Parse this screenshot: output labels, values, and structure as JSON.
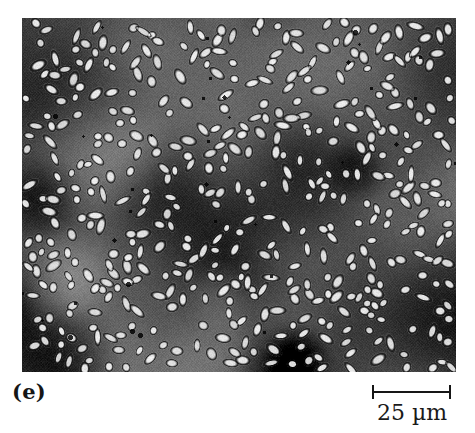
{
  "figure": {
    "panel_label": "(e)",
    "kind": "phase-contrast light micrograph",
    "frame": {
      "x": 22,
      "y": 18,
      "width": 434,
      "height": 354
    }
  },
  "scalebar": {
    "label": "25 µm",
    "value": 25,
    "unit": "µm",
    "bar_length_px": 79,
    "color": "#161616"
  },
  "palette": {
    "page_background": "#ffffff",
    "ink": "#161616",
    "field_mid_grey": "#6a6a6a",
    "field_dark_grey": "#343434",
    "field_light_grey": "#9a9a9a",
    "cell_halo_white": "#f2f2f2",
    "cell_outline_black": "#141414"
  },
  "render": {
    "seed": 20250607,
    "cell_count": 470,
    "cell_length_min_px": 7,
    "cell_length_max_px": 15,
    "cell_width_min_px": 5,
    "cell_width_max_px": 8,
    "halftone_period_px": 3,
    "blob_count": 46,
    "vignette_strength": 0.22
  }
}
